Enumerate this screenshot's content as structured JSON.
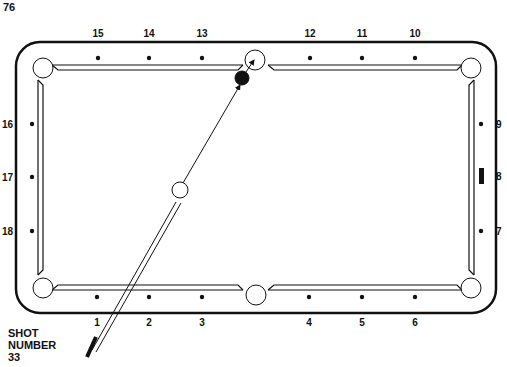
{
  "page_number": "76",
  "shot": {
    "line1": "SHOT",
    "line2": "NUMBER",
    "number": "33"
  },
  "colors": {
    "ink": "#111111",
    "paper": "#ffffff"
  },
  "diamonds": {
    "top": [
      {
        "label": "15",
        "x": 98
      },
      {
        "label": "14",
        "x": 149
      },
      {
        "label": "13",
        "x": 202
      },
      {
        "label": "12",
        "x": 310
      },
      {
        "label": "11",
        "x": 362
      },
      {
        "label": "10",
        "x": 415
      }
    ],
    "bottom": [
      {
        "label": "1",
        "x": 97
      },
      {
        "label": "2",
        "x": 149
      },
      {
        "label": "3",
        "x": 202
      },
      {
        "label": "4",
        "x": 309
      },
      {
        "label": "5",
        "x": 362
      },
      {
        "label": "6",
        "x": 415
      }
    ],
    "left": [
      {
        "label": "16",
        "y": 124
      },
      {
        "label": "17",
        "y": 177
      },
      {
        "label": "18",
        "y": 231
      }
    ],
    "right": [
      {
        "label": "9",
        "y": 124
      },
      {
        "label": "8",
        "y": 176
      },
      {
        "label": "7",
        "y": 231
      }
    ]
  },
  "balls": {
    "cue_ball": {
      "x": 180,
      "y": 190,
      "r": 8,
      "fill": "#ffffff"
    },
    "object_ball": {
      "x": 242,
      "y": 78,
      "r": 7,
      "fill": "#111111"
    }
  },
  "target_pocket": "top-middle",
  "shot_path": {
    "from": [
      183,
      183
    ],
    "to": [
      240,
      85
    ]
  },
  "object_path": {
    "from": [
      246,
      72
    ],
    "to": [
      254,
      60
    ]
  }
}
